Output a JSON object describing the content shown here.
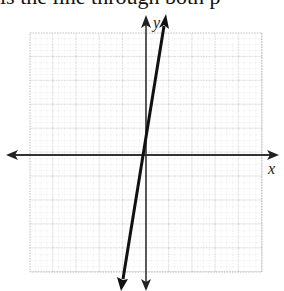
{
  "caption": "is the line through both p",
  "graph": {
    "x_axis_label": "x",
    "y_axis_label": "y",
    "grid": {
      "left": 30,
      "top": 33,
      "right": 262,
      "bottom": 272,
      "major_cells": 10
    },
    "origin_px": [
      146,
      155
    ],
    "line": {
      "description": "steep line through origin",
      "top_px": [
        166,
        16
      ],
      "bottom_px": [
        121,
        287
      ]
    },
    "colors": {
      "axis": "#333333",
      "line": "#111111",
      "grid": "#bbbbbb"
    }
  }
}
